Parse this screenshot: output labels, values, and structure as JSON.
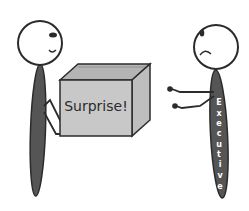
{
  "scene": {
    "description": "Cartoon of a stick figure handing a box to an unhappy executive",
    "box": {
      "label": "Surprise!"
    },
    "giver": {
      "expression": "smile"
    },
    "receiver": {
      "expression": "frown",
      "body_label": "Executive",
      "body_letters": [
        "E",
        "x",
        "e",
        "c",
        "u",
        "t",
        "i",
        "v",
        "e"
      ]
    }
  },
  "colors": {
    "background": "#ffffff",
    "outline": "#2b2b2b",
    "body_fill": "#555555",
    "box_front": "#c8c8c8",
    "box_top": "#b4b4b4",
    "box_side": "#bebebe",
    "body_text": "#ffffff"
  }
}
